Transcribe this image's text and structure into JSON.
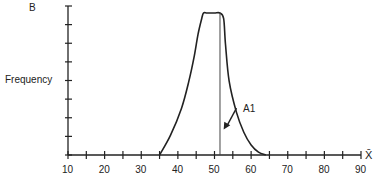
{
  "chart_data": {
    "type": "line",
    "panel_label": "B",
    "title": "",
    "xlabel": "X̄",
    "ylabel": "Frequency",
    "xlim": [
      10,
      90
    ],
    "x_ticks_major": [
      10,
      20,
      30,
      40,
      50,
      60,
      70,
      80,
      90
    ],
    "x_tick_step_minor": 5,
    "y_ticks_count": 8,
    "y_tick_labels": [],
    "grid": false,
    "legend": null,
    "series": [
      {
        "name": "sampling distribution of mean",
        "x": [
          35,
          38,
          41,
          43,
          44.5,
          45.5,
          46.5,
          47,
          48,
          50,
          51.5,
          52.5,
          53,
          54,
          56,
          58,
          60,
          62,
          64
        ],
        "y": [
          0,
          0.14,
          0.33,
          0.52,
          0.7,
          0.85,
          0.96,
          1.0,
          1.0,
          1.0,
          1.0,
          0.96,
          0.78,
          0.52,
          0.3,
          0.16,
          0.07,
          0.02,
          0
        ]
      }
    ],
    "annotations": [
      {
        "type": "vline",
        "x": 51.5,
        "label": ""
      },
      {
        "type": "arrow",
        "text": "A1",
        "from": [
          56,
          0.33
        ],
        "to": [
          52.5,
          0.18
        ]
      }
    ]
  }
}
